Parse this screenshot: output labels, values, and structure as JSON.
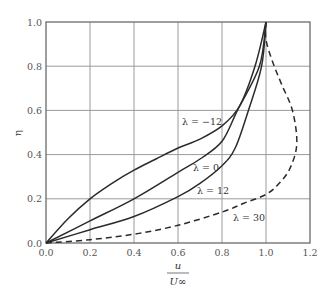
{
  "chart_data": {
    "type": "line",
    "title": "",
    "xlabel": "u / U∞",
    "xlabel_num": "u",
    "xlabel_den": "U∞",
    "ylabel": "η",
    "xlim": [
      0.0,
      1.2
    ],
    "ylim": [
      0.0,
      1.0
    ],
    "grid": true,
    "legend_position": "inline annotations",
    "x_ticks": [
      "0.0",
      "0.2",
      "0.4",
      "0.6",
      "0.8",
      "1.0",
      "1.2"
    ],
    "y_ticks": [
      "0.0",
      "0.2",
      "0.4",
      "0.6",
      "0.8",
      "1.0"
    ],
    "series": [
      {
        "name": "λ = −12",
        "label": "λ = −12",
        "style": "solid",
        "points": [
          [
            0,
            0
          ],
          [
            0.1,
            0.11
          ],
          [
            0.2,
            0.2
          ],
          [
            0.3,
            0.27
          ],
          [
            0.4,
            0.33
          ],
          [
            0.5,
            0.38
          ],
          [
            0.6,
            0.43
          ],
          [
            0.7,
            0.47
          ],
          [
            0.8,
            0.53
          ],
          [
            0.88,
            0.62
          ],
          [
            0.95,
            0.8
          ],
          [
            1.0,
            1.0
          ]
        ]
      },
      {
        "name": "λ = 0",
        "label": "λ = 0",
        "style": "solid",
        "points": [
          [
            0,
            0
          ],
          [
            0.2,
            0.1
          ],
          [
            0.4,
            0.2
          ],
          [
            0.6,
            0.32
          ],
          [
            0.7,
            0.38
          ],
          [
            0.8,
            0.46
          ],
          [
            0.87,
            0.6
          ],
          [
            0.97,
            0.8
          ],
          [
            1.0,
            1.0
          ]
        ]
      },
      {
        "name": "λ = 12",
        "label": "λ = 12",
        "style": "solid",
        "points": [
          [
            0,
            0
          ],
          [
            0.2,
            0.06
          ],
          [
            0.4,
            0.12
          ],
          [
            0.6,
            0.21
          ],
          [
            0.7,
            0.27
          ],
          [
            0.8,
            0.35
          ],
          [
            0.86,
            0.43
          ],
          [
            0.92,
            0.6
          ],
          [
            0.98,
            0.8
          ],
          [
            1.0,
            1.0
          ]
        ]
      },
      {
        "name": "λ = 30",
        "label": "λ = 30",
        "style": "dashed",
        "points": [
          [
            0,
            0
          ],
          [
            0.2,
            0.015
          ],
          [
            0.4,
            0.04
          ],
          [
            0.6,
            0.08
          ],
          [
            0.8,
            0.14
          ],
          [
            0.9,
            0.18
          ],
          [
            1.0,
            0.22
          ],
          [
            1.06,
            0.27
          ],
          [
            1.11,
            0.34
          ],
          [
            1.14,
            0.45
          ],
          [
            1.12,
            0.6
          ],
          [
            1.07,
            0.72
          ],
          [
            1.03,
            0.82
          ],
          [
            1.0,
            0.92
          ],
          [
            1.0,
            1.0
          ]
        ]
      }
    ]
  },
  "annotations": {
    "lambda_m12": "λ = −12",
    "lambda_0": "λ = 0",
    "lambda_12": "λ = 12",
    "lambda_30": "λ = 30"
  }
}
